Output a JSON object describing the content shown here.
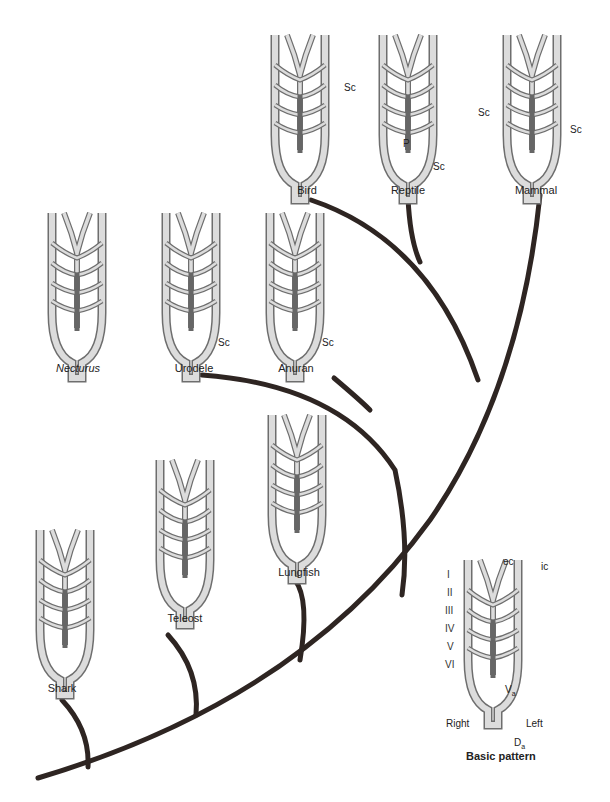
{
  "diagram": {
    "type": "phylogenetic tree of vertebrate aortic arches",
    "taxa": [
      {
        "id": "shark",
        "label": "Shark"
      },
      {
        "id": "teleost",
        "label": "Teleost"
      },
      {
        "id": "lungfish",
        "label": "Lungfish"
      },
      {
        "id": "necturus",
        "label": "Necturus"
      },
      {
        "id": "urodele",
        "label": "Urodele"
      },
      {
        "id": "anuran",
        "label": "Anuran"
      },
      {
        "id": "bird",
        "label": "Bird"
      },
      {
        "id": "reptile",
        "label": "Reptile"
      },
      {
        "id": "mammal",
        "label": "Mammal"
      }
    ],
    "annotations": {
      "sc": "Sc",
      "p": "P",
      "necturus_arches": [
        "III",
        "III",
        "IV",
        "V"
      ]
    },
    "basic_pattern": {
      "title": "Basic pattern",
      "arches": [
        "I",
        "II",
        "III",
        "IV",
        "V",
        "VI"
      ],
      "ec": "ec",
      "ic": "ic",
      "va": "V",
      "va_sub": "a",
      "da": "D",
      "da_sub": "a",
      "right": "Right",
      "left": "Left"
    },
    "colors": {
      "branch": "#2e2522",
      "vessel_fill": "#d9d9d9",
      "vessel_stroke": "#6e6e6e",
      "ventral_aorta": "#666666"
    }
  }
}
